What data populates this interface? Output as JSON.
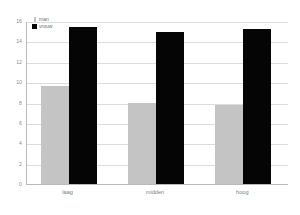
{
  "chart_data": {
    "type": "bar",
    "title": "",
    "subtitle": "",
    "xlabel": "",
    "ylabel": "",
    "categories": [
      "laag",
      "midden",
      "hoog"
    ],
    "series": [
      {
        "name": "man",
        "color": "#c4c4c4",
        "values": [
          9.6,
          8.0,
          7.8
        ]
      },
      {
        "name": "vrouw",
        "color": "#050505",
        "values": [
          15.4,
          14.9,
          15.2
        ]
      }
    ],
    "ylim": [
      0,
      16
    ],
    "ytick_values": [
      16,
      14,
      12,
      10,
      8,
      6,
      4,
      2,
      0
    ],
    "ytick_labels": [
      "16",
      "14",
      "12",
      "10",
      "8",
      "6",
      "4",
      "2",
      "0"
    ],
    "grid": true,
    "grid_axis": "y",
    "legend_position": "top-left",
    "background_color": "#ffffff",
    "axis_color": "#b9b9b9",
    "grid_color": "#dcdcdc"
  },
  "legend": {
    "entries": [
      {
        "label": "man",
        "swatch": "legend-swatch-man"
      },
      {
        "label": "vrouw",
        "swatch": "legend-swatch-vrouw"
      }
    ]
  }
}
